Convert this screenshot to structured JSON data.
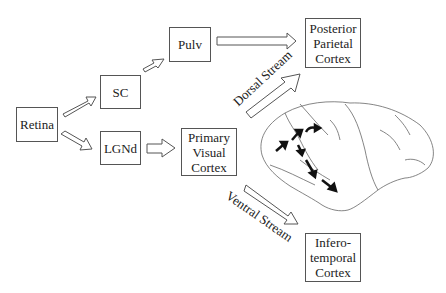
{
  "nodes": {
    "retina": "Retina",
    "sc": "SC",
    "lgnd": "LGNd",
    "pulv": "Pulv",
    "v1": "Primary\nVisual\nCortex",
    "ppc": "Posterior\nParietal\nCortex",
    "it": "Infero-\ntemporal\nCortex"
  },
  "streams": {
    "dorsal": "Dorsal  Stream",
    "ventral": "Ventral  Stream"
  },
  "colors": {
    "line": "#555555",
    "arrow_fill": "#ffffff",
    "brain_arrow": "#111111"
  }
}
